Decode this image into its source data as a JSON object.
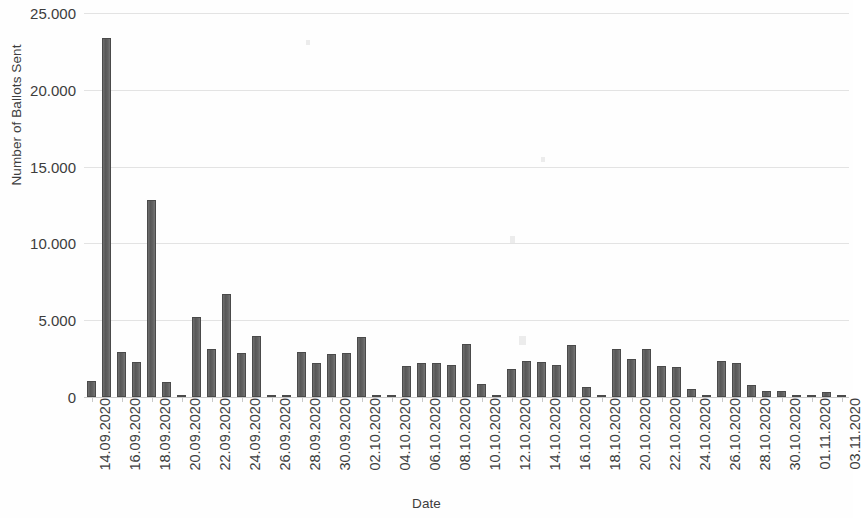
{
  "chart_data": {
    "type": "bar",
    "title": "",
    "xlabel": "Date",
    "ylabel": "Number of Ballots Sent",
    "ylim": [
      0,
      25000
    ],
    "ytick_values": [
      0,
      5000,
      10000,
      15000,
      20000,
      25000
    ],
    "ytick_labels": [
      "0",
      "5.000",
      "10.000",
      "15.000",
      "20.000",
      "25.000"
    ],
    "grid": true,
    "legend": "none",
    "bar_color": "#5e5e5e",
    "gridline_color": "#e3e3e3",
    "axis_color": "#c9c9c9",
    "tick_label_interval": 2,
    "x_tick_labels": [
      "14.09.2020",
      "16.09.2020",
      "18.09.2020",
      "20.09.2020",
      "22.09.2020",
      "24.09.2020",
      "26.09.2020",
      "28.09.2020",
      "30.09.2020",
      "02.10.2020",
      "04.10.2020",
      "06.10.2020",
      "08.10.2020",
      "10.10.2020",
      "12.10.2020",
      "14.10.2020",
      "16.10.2020",
      "18.10.2020",
      "20.10.2020",
      "22.10.2020",
      "24.10.2020",
      "26.10.2020",
      "28.10.2020",
      "30.10.2020",
      "01.11.2020",
      "03.11.2020"
    ],
    "categories": [
      "14.09.2020",
      "15.09.2020",
      "16.09.2020",
      "17.09.2020",
      "18.09.2020",
      "19.09.2020",
      "20.09.2020",
      "21.09.2020",
      "22.09.2020",
      "23.09.2020",
      "24.09.2020",
      "25.09.2020",
      "26.09.2020",
      "27.09.2020",
      "28.09.2020",
      "29.09.2020",
      "30.09.2020",
      "01.10.2020",
      "02.10.2020",
      "03.10.2020",
      "04.10.2020",
      "05.10.2020",
      "06.10.2020",
      "07.10.2020",
      "08.10.2020",
      "09.10.2020",
      "10.10.2020",
      "11.10.2020",
      "12.10.2020",
      "13.10.2020",
      "14.10.2020",
      "15.10.2020",
      "16.10.2020",
      "17.10.2020",
      "18.10.2020",
      "19.10.2020",
      "20.10.2020",
      "21.10.2020",
      "22.10.2020",
      "23.10.2020",
      "24.10.2020",
      "25.10.2020",
      "26.10.2020",
      "27.10.2020",
      "28.10.2020",
      "29.10.2020",
      "30.10.2020",
      "31.10.2020",
      "01.11.2020",
      "02.11.2020",
      "03.11.2020"
    ],
    "values": [
      1050,
      23400,
      2900,
      2250,
      12800,
      950,
      120,
      5200,
      3150,
      6700,
      2850,
      3950,
      100,
      60,
      2950,
      2200,
      2800,
      2850,
      3900,
      120,
      80,
      2050,
      2200,
      2200,
      2100,
      3450,
      850,
      60,
      1800,
      2350,
      2250,
      2100,
      3400,
      650,
      50,
      3100,
      2450,
      3150,
      2000,
      1950,
      550,
      80,
      2350,
      2200,
      750,
      420,
      400,
      70,
      60,
      350,
      60
    ]
  }
}
